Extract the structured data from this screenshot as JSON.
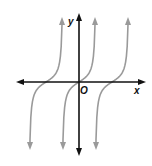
{
  "chart_data": {
    "type": "line",
    "title": "",
    "function": "y = tan(x) style periodic branches (vertically asymptotic)",
    "xlabel": "x",
    "ylabel": "y",
    "origin_label": "O",
    "grid": false,
    "legend": "none",
    "xlim": [
      -2,
      2
    ],
    "ylim": [
      -2.2,
      2.2
    ],
    "period": 1,
    "branch_zeros": [
      -1,
      0,
      1
    ],
    "branches": [
      {
        "name": "branch-left",
        "zero": -1
      },
      {
        "name": "branch-center",
        "zero": 0
      },
      {
        "name": "branch-right",
        "zero": 1
      }
    ],
    "colors": {
      "axes": "#111111",
      "curves": "#9a9a9a"
    }
  }
}
